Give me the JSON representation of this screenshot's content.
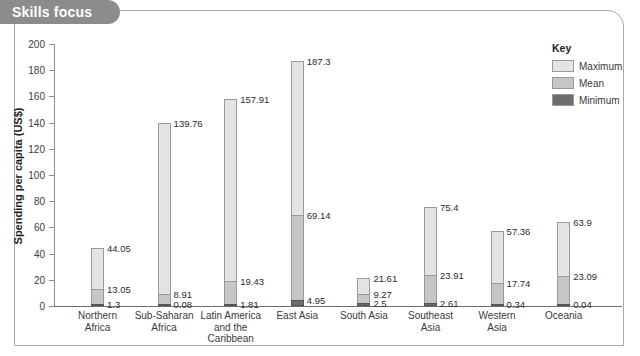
{
  "panel": {
    "title": "Skills focus"
  },
  "legend": {
    "title": "Key",
    "items": [
      {
        "label": "Maximum",
        "color": "#e4e4e4"
      },
      {
        "label": "Mean",
        "color": "#c6c6c6"
      },
      {
        "label": "Minimum",
        "color": "#6d6d6d"
      }
    ]
  },
  "chart_data": {
    "type": "bar",
    "title": "Skills focus",
    "xlabel": "",
    "ylabel": "Spending per capita (US$)",
    "ylim": [
      0,
      200
    ],
    "yticks": [
      0,
      20,
      40,
      60,
      80,
      100,
      120,
      140,
      160,
      180,
      200
    ],
    "grid": false,
    "legend_position": "right",
    "categories": [
      "Northern Africa",
      "Sub-Saharan Africa",
      "Latin America and the Caribbean",
      "East Asia",
      "South Asia",
      "Southeast Asia",
      "Western Asia",
      "Oceania"
    ],
    "category_lines": [
      [
        "Northern",
        "Africa"
      ],
      [
        "Sub-Saharan",
        "Africa"
      ],
      [
        "Latin America",
        "and the",
        "Caribbean"
      ],
      [
        "East Asia"
      ],
      [
        "South Asia"
      ],
      [
        "Southeast",
        "Asia"
      ],
      [
        "Western",
        "Asia"
      ],
      [
        "Oceania"
      ]
    ],
    "series": [
      {
        "name": "Maximum",
        "values": [
          44.05,
          139.76,
          157.91,
          187.3,
          21.61,
          75.4,
          57.36,
          63.9
        ]
      },
      {
        "name": "Mean",
        "values": [
          13.05,
          8.91,
          19.43,
          69.14,
          9.27,
          23.91,
          17.74,
          23.09
        ]
      },
      {
        "name": "Minimum",
        "values": [
          1.3,
          0.08,
          1.81,
          4.95,
          2.5,
          2.61,
          0.34,
          0.04
        ]
      }
    ],
    "labels": {
      "Maximum": [
        "44.05",
        "139.76",
        "157.91",
        "187.3",
        "21.61",
        "75.4",
        "57.36",
        "63.9"
      ],
      "Mean": [
        "13.05",
        "8.91",
        "19.43",
        "69.14",
        "9.27",
        "23.91",
        "17.74",
        "23.09"
      ],
      "Minimum": [
        "1.3",
        "0.08",
        "1.81",
        "4.95",
        "2.5",
        "2.61",
        "0.34",
        "0.04"
      ]
    }
  }
}
